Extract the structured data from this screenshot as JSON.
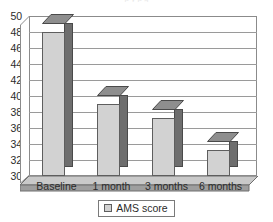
{
  "clipped_title": "p          y                         p     g",
  "chart_data": {
    "type": "bar",
    "title": "",
    "subtitle": "",
    "xlabel": "",
    "ylabel": "",
    "categories": [
      "Baseline",
      "1 month",
      "3 months",
      "6 months"
    ],
    "values": [
      48.0,
      39.0,
      37.3,
      33.2
    ],
    "series": [
      {
        "name": "AMS score",
        "values": [
          48.0,
          39.0,
          37.3,
          33.2
        ]
      }
    ],
    "ylim": [
      30,
      50
    ],
    "ytick_step": 2,
    "yticks": [
      50,
      48,
      46,
      44,
      42,
      40,
      38,
      36,
      34,
      32,
      30
    ],
    "ytick_labels": [
      "50",
      "48",
      "46",
      "44",
      "42",
      "40",
      "38",
      "36",
      "34",
      "32",
      "30"
    ],
    "grid": true,
    "grid_axis": "y",
    "legend": [
      "AMS score"
    ],
    "legend_position": "bottom-center",
    "style": "3d-column",
    "annotations": []
  },
  "colors": {
    "bar_front": "#d2d2d2",
    "bar_side": "#6e6e6e",
    "bar_top": "#8e8e8e",
    "bar_outline": "#5e5e5e",
    "gridline": "#9a9a9a",
    "frame": "#8b8b8b",
    "text": "#2b2b2b",
    "background": "#ffffff"
  },
  "legend": {
    "swatch_name": "ams-score-swatch",
    "label": "AMS score"
  }
}
